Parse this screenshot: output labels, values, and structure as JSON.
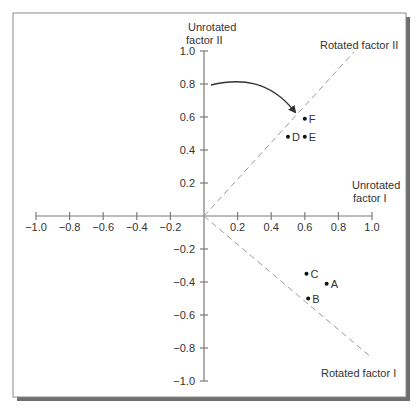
{
  "frame": {
    "border_color": "#8a8a8a",
    "shadow_color": "#6e6e6e",
    "background": "#ffffff"
  },
  "colors": {
    "axis": "#7a7a7a",
    "dashed": "#9a9a9a",
    "text": "#333333",
    "point": "#111111",
    "arrow": "#333333"
  },
  "axes": {
    "y_title_line1": "Unrotated",
    "y_title_line2": "factor II",
    "x_title_line1": "Unrotated",
    "x_title_line2": "factor I",
    "x_ticks": [
      {
        "v": -1.0,
        "label": "−1.0"
      },
      {
        "v": -0.8,
        "label": "−0.8"
      },
      {
        "v": -0.6,
        "label": "−0.6"
      },
      {
        "v": -0.4,
        "label": "−0.4"
      },
      {
        "v": -0.2,
        "label": "−0.2"
      },
      {
        "v": 0.2,
        "label": "0.2"
      },
      {
        "v": 0.4,
        "label": "0.4"
      },
      {
        "v": 0.6,
        "label": "0.6"
      },
      {
        "v": 0.8,
        "label": "0.8"
      },
      {
        "v": 1.0,
        "label": "1.0"
      }
    ],
    "y_ticks": [
      {
        "v": 1.0,
        "label": "1.0"
      },
      {
        "v": 0.8,
        "label": "0.8"
      },
      {
        "v": 0.6,
        "label": "0.6"
      },
      {
        "v": 0.4,
        "label": "0.4"
      },
      {
        "v": 0.2,
        "label": "0.2"
      },
      {
        "v": -0.2,
        "label": "−0.2"
      },
      {
        "v": -0.4,
        "label": "−0.4"
      },
      {
        "v": -0.6,
        "label": "−0.6"
      },
      {
        "v": -0.8,
        "label": "−0.8"
      },
      {
        "v": -1.0,
        "label": "−1.0"
      }
    ]
  },
  "rotated_axes": {
    "factor_ii_label": "Rotated factor II",
    "factor_i_label": "Rotated factor I"
  },
  "chart_data": {
    "type": "scatter",
    "title": "",
    "xlabel": "Unrotated factor I",
    "ylabel": "Unrotated factor II",
    "xlim": [
      -1.0,
      1.0
    ],
    "ylim": [
      -1.0,
      1.0
    ],
    "grid": false,
    "points": [
      {
        "label": "A",
        "x": 0.73,
        "y": -0.41
      },
      {
        "label": "B",
        "x": 0.62,
        "y": -0.5
      },
      {
        "label": "C",
        "x": 0.61,
        "y": -0.35
      },
      {
        "label": "D",
        "x": 0.5,
        "y": 0.48
      },
      {
        "label": "E",
        "x": 0.6,
        "y": 0.48
      },
      {
        "label": "F",
        "x": 0.6,
        "y": 0.59
      }
    ],
    "rotated_axes": [
      {
        "name": "Rotated factor II",
        "direction": [
          0.9,
          1.0
        ],
        "style": "dashed"
      },
      {
        "name": "Rotated factor I",
        "direction": [
          1.0,
          -0.86
        ],
        "style": "dashed"
      }
    ],
    "annotations": [
      {
        "type": "curved-arrow",
        "from": [
          0.04,
          0.8
        ],
        "to": [
          0.54,
          0.62
        ],
        "meaning": "rotation of axes"
      }
    ]
  }
}
